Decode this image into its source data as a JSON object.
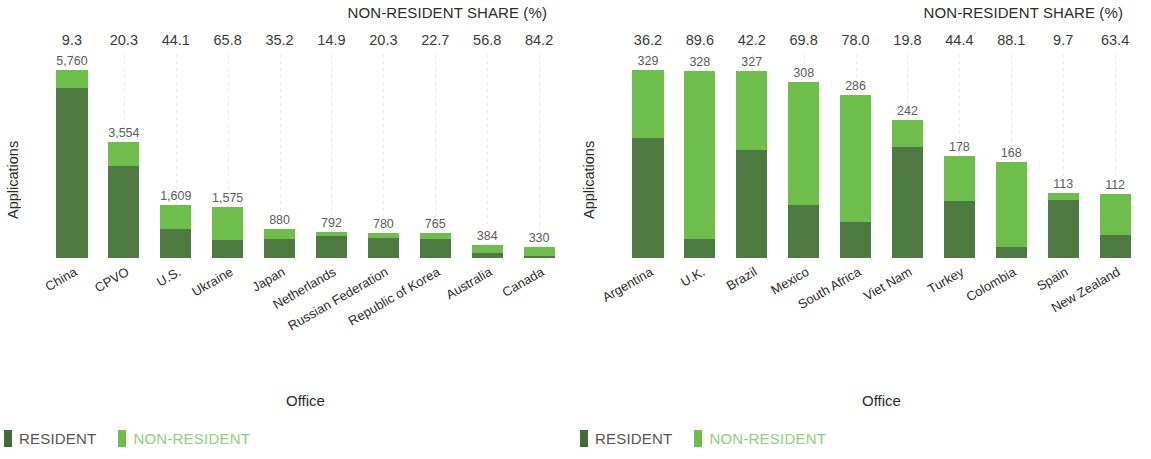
{
  "colors": {
    "resident": "#4e7a42",
    "non_resident": "#6dbe4b",
    "legend_resident_swatch": "#3f6b38",
    "legend_resident_text": "#555555",
    "legend_non_resident_text": "#8ed07a",
    "gridline": "#e9e9e9"
  },
  "legend": {
    "resident_label": "RESIDENT",
    "non_resident_label": "NON-RESIDENT"
  },
  "share_header": "NON-RESIDENT SHARE (%)",
  "axis": {
    "y_title": "Applications",
    "x_title": "Office"
  },
  "chart_data": [
    {
      "type": "bar",
      "title": "",
      "subtitle": "",
      "panel": "left",
      "stacked": true,
      "xlabel": "Office",
      "ylabel": "Applications",
      "ylim": [
        0,
        5760
      ],
      "grid": "vertical-dotted",
      "legend_position": "bottom-left",
      "annotation_row_title": "NON-RESIDENT SHARE (%)",
      "categories": [
        "China",
        "CPVO",
        "U.S.",
        "Ukraine",
        "Japan",
        "Netherlands",
        "Russian Federation",
        "Republic of Korea",
        "Australia",
        "Canada"
      ],
      "totals": [
        5760,
        3554,
        1609,
        1575,
        880,
        792,
        780,
        765,
        384,
        330
      ],
      "total_labels": [
        "5,760",
        "3,554",
        "1,609",
        "1,575",
        "880",
        "792",
        "780",
        "765",
        "384",
        "330"
      ],
      "non_resident_share_pct": [
        9.3,
        20.3,
        44.1,
        65.8,
        35.2,
        14.9,
        20.3,
        22.7,
        56.8,
        84.2
      ],
      "non_resident_share_labels": [
        "9.3",
        "20.3",
        "44.1",
        "65.8",
        "35.2",
        "14.9",
        "20.3",
        "22.7",
        "56.8",
        "84.2"
      ],
      "series": [
        {
          "name": "RESIDENT",
          "color": "#4e7a42",
          "values": [
            5224,
            2833,
            900,
            539,
            570,
            674,
            622,
            591,
            166,
            52
          ]
        },
        {
          "name": "NON-RESIDENT",
          "color": "#6dbe4b",
          "values": [
            536,
            721,
            709,
            1036,
            310,
            118,
            158,
            174,
            218,
            278
          ]
        }
      ]
    },
    {
      "type": "bar",
      "title": "",
      "subtitle": "",
      "panel": "right",
      "stacked": true,
      "xlabel": "Office",
      "ylabel": "Applications",
      "ylim": [
        0,
        329
      ],
      "grid": "vertical-dotted",
      "legend_position": "bottom-left",
      "annotation_row_title": "NON-RESIDENT SHARE (%)",
      "categories": [
        "Argentina",
        "U.K.",
        "Brazil",
        "Mexico",
        "South Africa",
        "Viet Nam",
        "Turkey",
        "Colombia",
        "Spain",
        "New Zealand"
      ],
      "totals": [
        329,
        328,
        327,
        308,
        286,
        242,
        178,
        168,
        113,
        112
      ],
      "total_labels": [
        "329",
        "328",
        "327",
        "308",
        "286",
        "242",
        "178",
        "168",
        "113",
        "112"
      ],
      "non_resident_share_pct": [
        36.2,
        89.6,
        42.2,
        69.8,
        78.0,
        19.8,
        44.4,
        88.1,
        9.7,
        63.4
      ],
      "non_resident_share_labels": [
        "36.2",
        "89.6",
        "42.2",
        "69.8",
        "78.0",
        "19.8",
        "44.4",
        "88.1",
        "9.7",
        "63.4"
      ],
      "series": [
        {
          "name": "RESIDENT",
          "color": "#4e7a42",
          "values": [
            210,
            34,
            189,
            93,
            63,
            194,
            99,
            20,
            102,
            41
          ]
        },
        {
          "name": "NON-RESIDENT",
          "color": "#6dbe4b",
          "values": [
            119,
            294,
            138,
            215,
            223,
            48,
            79,
            148,
            11,
            71
          ]
        }
      ]
    }
  ]
}
